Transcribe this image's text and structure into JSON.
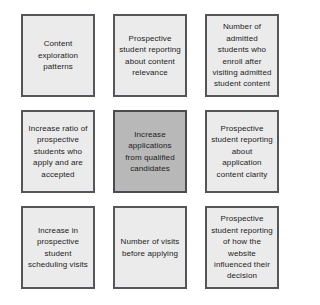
{
  "diagram": {
    "type": "3x3-grid",
    "columns": 3,
    "rows": 3,
    "background_color": "#ffffff",
    "cell_fill_color": "#ebebeb",
    "highlight_fill_color": "#b8b8b8",
    "border_color": "#54565a",
    "cells": [
      {
        "position": "top-left",
        "row": 1,
        "column": 1,
        "label": "Content exploration patterns",
        "highlighted": false
      },
      {
        "position": "top-center",
        "row": 1,
        "column": 2,
        "label": "Prospective student reporting about content relevance",
        "highlighted": false
      },
      {
        "position": "top-right",
        "row": 1,
        "column": 3,
        "label": "Number of admitted students who enroll after visiting admitted student content",
        "highlighted": false
      },
      {
        "position": "middle-left",
        "row": 2,
        "column": 1,
        "label": "Increase ratio of prospective students who apply and are accepted",
        "highlighted": false
      },
      {
        "position": "middle-center",
        "row": 2,
        "column": 2,
        "label": "Increase applications from qualified candidates",
        "highlighted": true
      },
      {
        "position": "middle-right",
        "row": 2,
        "column": 3,
        "label": "Prospective student reporting about application content clarity",
        "highlighted": false
      },
      {
        "position": "bottom-left",
        "row": 3,
        "column": 1,
        "label": "Increase in prospective student scheduling visits",
        "highlighted": false
      },
      {
        "position": "bottom-center",
        "row": 3,
        "column": 2,
        "label": "Number of visits before applying",
        "highlighted": false
      },
      {
        "position": "bottom-right",
        "row": 3,
        "column": 3,
        "label": "Prospective student reporting of how the website influenced their decision",
        "highlighted": false
      }
    ]
  }
}
